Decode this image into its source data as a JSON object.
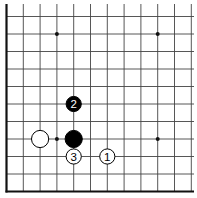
{
  "diagram": {
    "type": "go-board-partial",
    "view": "lower-left corner region",
    "grid": {
      "origin_x": 6.5,
      "origin_y": 191.5,
      "col_spacing": 16.8,
      "row_spacing": 17.5,
      "columns": 12,
      "rows": 11,
      "top_y": 4,
      "right_x": 194,
      "line_color": "#444444",
      "edge_color": "#111111"
    },
    "star_points": [
      {
        "col": 3,
        "row": 3
      },
      {
        "col": 3,
        "row": 9
      },
      {
        "col": 9,
        "row": 3
      },
      {
        "col": 9,
        "row": 9
      }
    ],
    "stones": [
      {
        "name": "white-stone",
        "color": "white",
        "col": 2,
        "row": 3,
        "label": ""
      },
      {
        "name": "black-stone",
        "color": "black",
        "col": 4,
        "row": 3,
        "label": ""
      },
      {
        "name": "move-1",
        "color": "white",
        "col": 6,
        "row": 2,
        "label": "1"
      },
      {
        "name": "move-2",
        "color": "black",
        "col": 4,
        "row": 5,
        "label": "2"
      },
      {
        "name": "move-3",
        "color": "white",
        "col": 4,
        "row": 2,
        "label": "3"
      }
    ]
  }
}
